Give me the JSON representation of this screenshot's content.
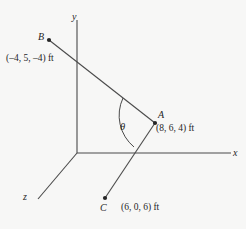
{
  "figure": {
    "background_color": "#f7f7f6",
    "stroke_color": "#4a4a4a",
    "text_color": "#262626",
    "axes": [
      {
        "name": "y",
        "label": "y"
      },
      {
        "name": "x",
        "label": "x"
      },
      {
        "name": "z",
        "label": "z"
      }
    ],
    "points": [
      {
        "id": "B",
        "label": "B",
        "coord_label": "(–4, 5, –4) ft",
        "coords": [
          -4,
          5,
          -4
        ],
        "unit": "ft"
      },
      {
        "id": "A",
        "label": "A",
        "coord_label": "(8, 6, 4) ft",
        "coords": [
          8,
          6,
          4
        ],
        "unit": "ft"
      },
      {
        "id": "C",
        "label": "C",
        "coord_label": "(6, 0, 6) ft",
        "coords": [
          6,
          0,
          6
        ],
        "unit": "ft"
      }
    ],
    "angle": {
      "label": "θ",
      "vertex": "A",
      "between": [
        "AB",
        "AC"
      ]
    },
    "segments": [
      {
        "from": "B",
        "to": "A"
      },
      {
        "from": "A",
        "to": "C"
      }
    ]
  }
}
